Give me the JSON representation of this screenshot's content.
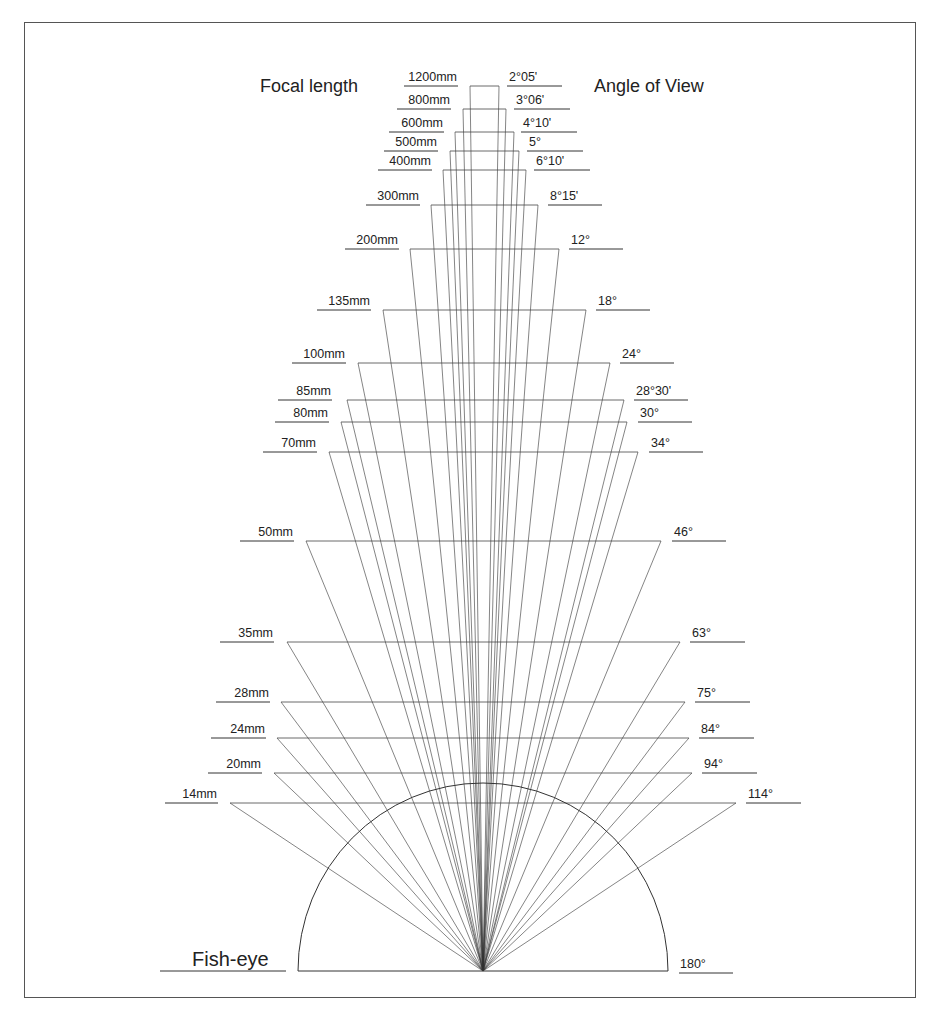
{
  "titles": {
    "focal_length": "Focal length",
    "angle_of_view": "Angle of View",
    "fish_eye": "Fish-eye",
    "fish_eye_angle": "180°"
  },
  "colors": {
    "line": "#333333",
    "text": "#222222",
    "frame": "#555555",
    "background": "#ffffff"
  },
  "geometry": {
    "apex": {
      "x": 483,
      "y": 971
    },
    "frame": {
      "left": 24,
      "top": 22,
      "right": 917,
      "bottom": 999
    },
    "fisheye": {
      "left": 298,
      "right": 668,
      "baseline_y": 971,
      "top_y": 783
    }
  },
  "chart_data": {
    "type": "diagram",
    "lenses": [
      {
        "focal": "1200mm",
        "angle": "2°05'",
        "y": 86,
        "xl": 470,
        "xr": 499,
        "lab_l": [
          404,
          458
        ],
        "lab_r": [
          507,
          562
        ]
      },
      {
        "focal": "800mm",
        "angle": "3°06'",
        "y": 109,
        "xl": 463,
        "xr": 506,
        "lab_l": [
          397,
          451
        ],
        "lab_r": [
          514,
          570
        ]
      },
      {
        "focal": "600mm",
        "angle": "4°10'",
        "y": 132,
        "xl": 455,
        "xr": 514,
        "lab_l": [
          389,
          444
        ],
        "lab_r": [
          521,
          577
        ]
      },
      {
        "focal": "500mm",
        "angle": "5°",
        "y": 151,
        "xl": 450,
        "xr": 519,
        "lab_l": [
          384,
          438
        ],
        "lab_r": [
          527,
          583
        ]
      },
      {
        "focal": "400mm",
        "angle": "6°10'",
        "y": 170,
        "xl": 443,
        "xr": 526,
        "lab_l": [
          378,
          432
        ],
        "lab_r": [
          534,
          590
        ]
      },
      {
        "focal": "300mm",
        "angle": "8°15'",
        "y": 205,
        "xl": 431,
        "xr": 538,
        "lab_l": [
          366,
          420
        ],
        "lab_r": [
          548,
          602
        ]
      },
      {
        "focal": "200mm",
        "angle": "12°",
        "y": 249,
        "xl": 410,
        "xr": 559,
        "lab_l": [
          345,
          399
        ],
        "lab_r": [
          569,
          623
        ]
      },
      {
        "focal": "135mm",
        "angle": "18°",
        "y": 310,
        "xl": 383,
        "xr": 586,
        "lab_l": [
          317,
          371
        ],
        "lab_r": [
          596,
          650
        ]
      },
      {
        "focal": "100mm",
        "angle": "24°",
        "y": 363,
        "xl": 358,
        "xr": 610,
        "lab_l": [
          292,
          346
        ],
        "lab_r": [
          620,
          674
        ]
      },
      {
        "focal": "85mm",
        "angle": "28°30'",
        "y": 400,
        "xl": 347,
        "xr": 624,
        "lab_l": [
          278,
          332
        ],
        "lab_r": [
          634,
          688
        ]
      },
      {
        "focal": "80mm",
        "angle": "30°",
        "y": 422,
        "xl": 341,
        "xr": 627,
        "lab_l": [
          275,
          329
        ],
        "lab_r": [
          638,
          692
        ]
      },
      {
        "focal": "70mm",
        "angle": "34°",
        "y": 452,
        "xl": 329,
        "xr": 638,
        "lab_l": [
          263,
          317
        ],
        "lab_r": [
          649,
          703
        ]
      },
      {
        "focal": "50mm",
        "angle": "46°",
        "y": 541,
        "xl": 306,
        "xr": 661,
        "lab_l": [
          240,
          294
        ],
        "lab_r": [
          672,
          726
        ]
      },
      {
        "focal": "35mm",
        "angle": "63°",
        "y": 642,
        "xl": 287,
        "xr": 680,
        "lab_l": [
          220,
          274
        ],
        "lab_r": [
          690,
          745
        ]
      },
      {
        "focal": "28mm",
        "angle": "75°",
        "y": 702,
        "xl": 281,
        "xr": 685,
        "lab_l": [
          216,
          270
        ],
        "lab_r": [
          695,
          750
        ]
      },
      {
        "focal": "24mm",
        "angle": "84°",
        "y": 738,
        "xl": 277,
        "xr": 689,
        "lab_l": [
          211,
          266
        ],
        "lab_r": [
          699,
          754
        ]
      },
      {
        "focal": "20mm",
        "angle": "94°",
        "y": 773,
        "xl": 274,
        "xr": 692,
        "lab_l": [
          208,
          262
        ],
        "lab_r": [
          702,
          757
        ]
      },
      {
        "focal": "14mm",
        "angle": "114°",
        "y": 803,
        "xl": 230,
        "xr": 736,
        "lab_l": [
          165,
          218
        ],
        "lab_r": [
          746,
          801
        ]
      }
    ],
    "fisheye": {
      "focal": "Fish-eye",
      "angle": "180°"
    }
  }
}
